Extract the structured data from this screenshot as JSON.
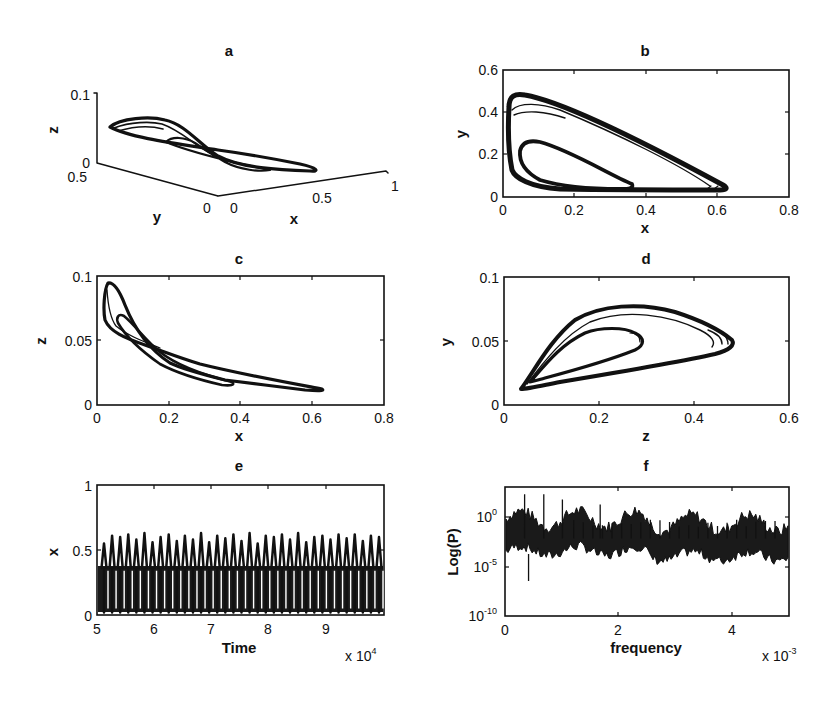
{
  "figure": {
    "panels": [
      "a",
      "b",
      "c",
      "d",
      "e",
      "f"
    ]
  },
  "chart_data": [
    {
      "id": "a",
      "type": "line",
      "title": "a",
      "projection": "3d",
      "xlabel": "x",
      "ylabel": "y",
      "zlabel": "z",
      "xlim": [
        0,
        1
      ],
      "ylim": [
        0,
        0.5
      ],
      "zlim": [
        0,
        0.1
      ],
      "xticks": [
        "0",
        "0.5",
        "1"
      ],
      "yticks": [
        "0",
        "0.5"
      ],
      "zticks": [
        "0",
        "0.1"
      ],
      "description": "3D chaotic attractor trajectory with two loops; projections shown in b, c, d"
    },
    {
      "id": "b",
      "type": "line",
      "title": "b",
      "xlabel": "x",
      "ylabel": "y",
      "xlim": [
        0,
        0.8
      ],
      "ylim": [
        0,
        0.6
      ],
      "xticks": [
        "0",
        "0.2",
        "0.4",
        "0.6",
        "0.8"
      ],
      "yticks": [
        "0",
        "0.2",
        "0.4",
        "0.6"
      ],
      "outer_loop": {
        "x": [
          0.63,
          0.3,
          0.1,
          0.04,
          0.02,
          0.03,
          0.1,
          0.3,
          0.55,
          0.63
        ],
        "y": [
          0.03,
          0.26,
          0.42,
          0.47,
          0.45,
          0.2,
          0.07,
          0.04,
          0.03,
          0.03
        ]
      },
      "inner_loop": {
        "x": [
          0.39,
          0.2,
          0.09,
          0.05,
          0.06,
          0.15,
          0.39
        ],
        "y": [
          0.06,
          0.18,
          0.26,
          0.24,
          0.18,
          0.08,
          0.06
        ]
      }
    },
    {
      "id": "c",
      "type": "line",
      "title": "c",
      "xlabel": "x",
      "ylabel": "z",
      "xlim": [
        0,
        0.8
      ],
      "ylim": [
        0,
        0.1
      ],
      "xticks": [
        "0",
        "0.2",
        "0.4",
        "0.6",
        "0.8"
      ],
      "yticks": [
        "0",
        "0.05",
        "0.1"
      ],
      "peak": {
        "x": 0.03,
        "z": 0.083
      },
      "tail": {
        "x": 0.63,
        "z": 0.012
      }
    },
    {
      "id": "d",
      "type": "line",
      "title": "d",
      "xlabel": "y",
      "ylabel": "z",
      "xlim": [
        0,
        0.6
      ],
      "ylim": [
        0,
        0.1
      ],
      "xticks": [
        "0",
        "0.2",
        "0.4",
        "0.6"
      ],
      "yticks": [
        "0",
        "0.05",
        "0.1"
      ],
      "outer_loop_max_y": 0.48,
      "outer_loop_max_z": 0.082,
      "inner_loop_max_y": 0.27,
      "inner_loop_max_z": 0.062,
      "vertex": {
        "y": 0.035,
        "z": 0.013
      }
    },
    {
      "id": "e",
      "type": "line",
      "title": "e",
      "xlabel": "Time",
      "ylabel": "x",
      "xlim": [
        5,
        10
      ],
      "ylim": [
        0,
        1
      ],
      "xticks": [
        "5",
        "6",
        "7",
        "8",
        "9"
      ],
      "yticks": [
        "0",
        "0.5",
        "1"
      ],
      "x_multiplier": "x 10^4",
      "series": [
        {
          "name": "x(t)",
          "band_low": 0.02,
          "band_high": 0.37,
          "spike_peaks": [
            0.55,
            0.61,
            0.6,
            0.62,
            0.58,
            0.63,
            0.56,
            0.6,
            0.62,
            0.57,
            0.61,
            0.58,
            0.63,
            0.56,
            0.61,
            0.59,
            0.62,
            0.57,
            0.63,
            0.55,
            0.61,
            0.6,
            0.62,
            0.58,
            0.63,
            0.56,
            0.6,
            0.61,
            0.58,
            0.62,
            0.59,
            0.62,
            0.57,
            0.61,
            0.6
          ]
        }
      ]
    },
    {
      "id": "f",
      "type": "line",
      "title": "f",
      "xlabel": "frequency",
      "ylabel": "Log(P)",
      "xlim": [
        0,
        5
      ],
      "ylim": [
        -10,
        2.5
      ],
      "yscale": "log",
      "xticks": [
        "0",
        "2",
        "4"
      ],
      "yticks": [
        "10^-10",
        "10^-5",
        "10^0"
      ],
      "x_multiplier": "x 10^-3",
      "series": [
        {
          "name": "power spectrum",
          "typical_log10": -3,
          "major_peaks": [
            {
              "f": 0.33,
              "log10P": 1.8
            },
            {
              "f": 0.67,
              "log10P": 1.8
            },
            {
              "f": 1.0,
              "log10P": 1.3
            },
            {
              "f": 1.67,
              "log10P": 0.8
            }
          ],
          "min_dip": {
            "f": 0.4,
            "log10P": -6.6
          }
        }
      ]
    }
  ],
  "labels": {
    "a": {
      "title": "a",
      "x": "x",
      "y": "y",
      "z": "z",
      "zt0": "0",
      "zt1": "0.1",
      "yt0": "0",
      "yt1": "0.5",
      "xt0": "0",
      "xt1": "0.5",
      "xt2": "1"
    },
    "b": {
      "title": "b",
      "x": "x",
      "y": "y",
      "xt": [
        "0",
        "0.2",
        "0.4",
        "0.6",
        "0.8"
      ],
      "yt": [
        "0",
        "0.2",
        "0.4",
        "0.6"
      ]
    },
    "c": {
      "title": "c",
      "x": "x",
      "y": "z",
      "xt": [
        "0",
        "0.2",
        "0.4",
        "0.6",
        "0.8"
      ],
      "yt": [
        "0",
        "0.05",
        "0.1"
      ]
    },
    "d": {
      "title": "d",
      "x": "y",
      "y": "z",
      "xt": [
        "0",
        "0.2",
        "0.4",
        "0.6"
      ],
      "yt": [
        "0",
        "0.05",
        "0.1"
      ]
    },
    "e": {
      "title": "e",
      "x": "Time",
      "y": "x",
      "xt": [
        "5",
        "6",
        "7",
        "8",
        "9"
      ],
      "yt": [
        "0",
        "0.5",
        "1"
      ],
      "mult_base": "x 10",
      "mult_exp": "4"
    },
    "f": {
      "title": "f",
      "x": "frequency",
      "y": "Log(P)",
      "xt": [
        "0",
        "2",
        "4"
      ],
      "yt_base": "10",
      "yt_exp": [
        "-10",
        "-5",
        "0"
      ],
      "mult_base": "x 10",
      "mult_exp": "-3"
    }
  }
}
